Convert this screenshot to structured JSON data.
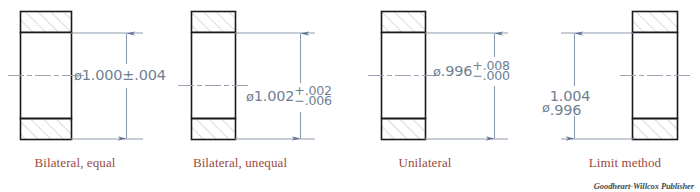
{
  "sheet": {
    "title": "Methods of specifying tolerances on a dimension",
    "publisher_credit": "Goodheart-Willcox Publisher",
    "colors": {
      "object_line": "#1a1a1a",
      "hatch_line": "#b5b5b5",
      "dimension_line": "#8d9cb0",
      "center_line": "#9aa6b4",
      "dimension_text": "#6f7f93",
      "label_text": "#9a4a40",
      "background": "#ffffff"
    }
  },
  "figures": [
    {
      "id": "bilateral-equal",
      "label": "Bilateral, equal",
      "dimension": {
        "symbol": "ø",
        "basic": "1.000",
        "format": "plus-minus",
        "plus_minus": "±.004",
        "full_text": "ø1.000±.004"
      }
    },
    {
      "id": "bilateral-unequal",
      "label": "Bilateral, unequal",
      "dimension": {
        "symbol": "ø",
        "basic": "1.002",
        "format": "stacked-tolerance",
        "upper": "+.002",
        "lower": "−.006",
        "full_text": "ø1.002 +.002 / −.006"
      }
    },
    {
      "id": "unilateral",
      "label": "Unilateral",
      "dimension": {
        "symbol": "ø",
        "basic": ".996",
        "format": "stacked-tolerance",
        "upper": "+.008",
        "lower": "−.000",
        "full_text": "ø.996 +.008 / −.000"
      }
    },
    {
      "id": "limit-method",
      "label": "Limit method",
      "dimension": {
        "symbol": "ø",
        "format": "stacked-limits",
        "upper_limit": "1.004",
        "lower_limit": ".996",
        "full_text": "ø 1.004 / .996"
      }
    }
  ]
}
